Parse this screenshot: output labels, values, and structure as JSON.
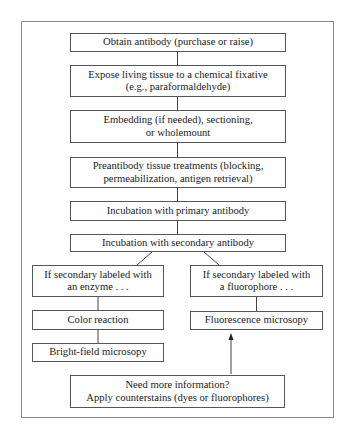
{
  "diagram": {
    "type": "flowchart",
    "nodes": [
      {
        "id": "obtain",
        "label": "Obtain antibody (purchase or raise)"
      },
      {
        "id": "fix",
        "label": "Expose living tissue to a chemical fixative\n(e.g., paraformaldehyde)"
      },
      {
        "id": "embed",
        "label": "Embedding (if needed), sectioning,\nor wholemount"
      },
      {
        "id": "pretreat",
        "label": "Preantibody tissue treatments (blocking,\npermeabilization, antigen retrieval)"
      },
      {
        "id": "primary",
        "label": "Incubation with primary antibody"
      },
      {
        "id": "secondary",
        "label": "Incubation with secondary antibody"
      },
      {
        "id": "enzyme",
        "label": "If secondary labeled with\nan enzyme . . ."
      },
      {
        "id": "fluor",
        "label": "If secondary labeled with\na fluorophore . . ."
      },
      {
        "id": "color",
        "label": "Color reaction"
      },
      {
        "id": "fluormicro",
        "label": "Fluorescence microsopy"
      },
      {
        "id": "brightfield",
        "label": "Bright-field microsopy"
      },
      {
        "id": "counterstain",
        "label": "Need more information?\nApply counterstains (dyes or fluorophores)"
      }
    ],
    "edges": [
      {
        "from": "obtain",
        "to": "fix"
      },
      {
        "from": "fix",
        "to": "embed"
      },
      {
        "from": "embed",
        "to": "pretreat"
      },
      {
        "from": "pretreat",
        "to": "primary"
      },
      {
        "from": "primary",
        "to": "secondary"
      },
      {
        "from": "secondary",
        "to": "enzyme"
      },
      {
        "from": "secondary",
        "to": "fluor"
      },
      {
        "from": "enzyme",
        "to": "color"
      },
      {
        "from": "color",
        "to": "brightfield"
      },
      {
        "from": "fluor",
        "to": "fluormicro"
      },
      {
        "from": "counterstain",
        "to": "fluormicro",
        "arrow": true
      }
    ]
  }
}
